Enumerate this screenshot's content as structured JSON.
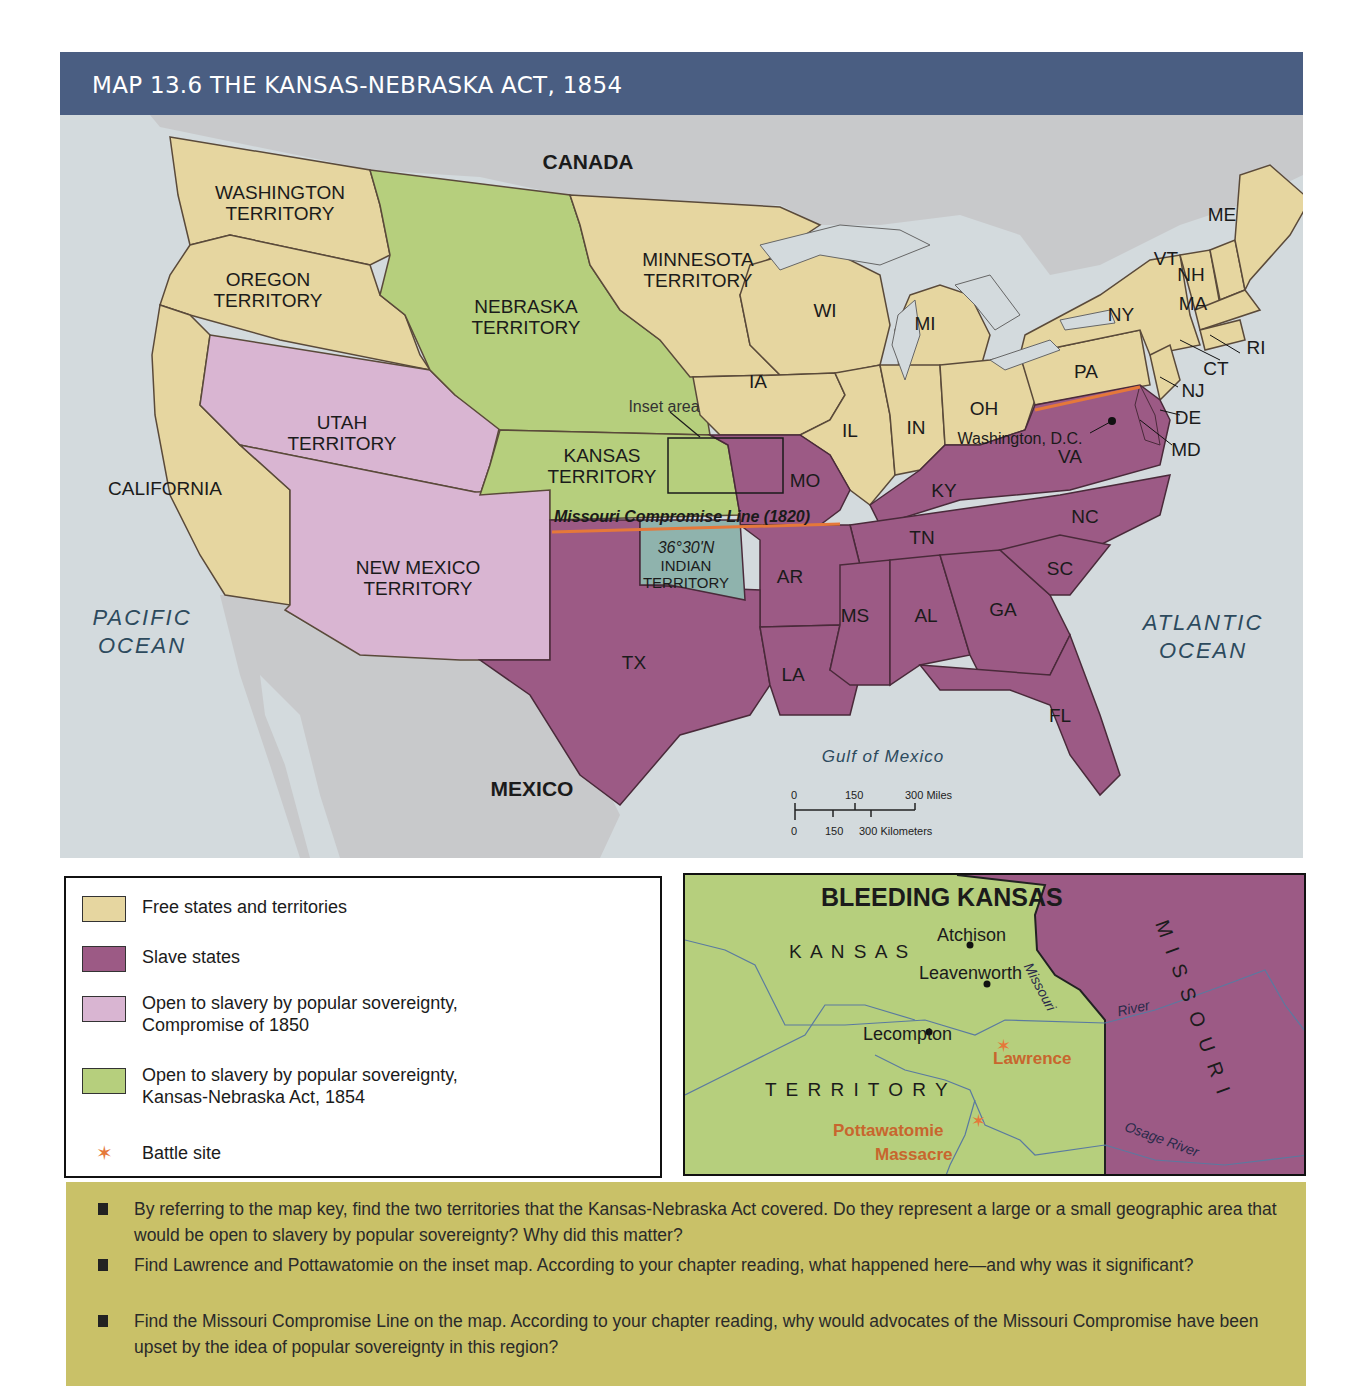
{
  "header": {
    "title": "MAP 13.6  THE KANSAS-NEBRASKA ACT, 1854"
  },
  "colors": {
    "header_bg": "#4a5e82",
    "free": "#e6d6a0",
    "slave": "#9c5a85",
    "compromise_1850": "#d9b5d2",
    "kansas_nebraska_1854": "#b6cf7d",
    "indian_territory": "#8fb3ad",
    "foreign_land": "#c8c9cb",
    "water": "#d3dadd",
    "missouri_line": "#e5783a",
    "question_box": "#c9c168"
  },
  "map": {
    "regions": {
      "canada": "CANADA",
      "mexico": "MEXICO",
      "pacific": "PACIFIC\nOCEAN",
      "atlantic": "ATLANTIC\nOCEAN",
      "gulf": "Gulf of Mexico"
    },
    "territories": {
      "washington": "WASHINGTON\nTERRITORY",
      "oregon": "OREGON\nTERRITORY",
      "california": "CALIFORNIA",
      "utah": "UTAH\nTERRITORY",
      "new_mexico": "NEW MEXICO\nTERRITORY",
      "nebraska": "NEBRASKA\nTERRITORY",
      "kansas": "KANSAS\nTERRITORY",
      "minnesota": "MINNESOTA\nTERRITORY",
      "indian": "INDIAN\nTERRITORY"
    },
    "states": {
      "wi": "WI",
      "mi": "MI",
      "ia": "IA",
      "il": "IL",
      "in": "IN",
      "oh": "OH",
      "ny": "NY",
      "pa": "PA",
      "me": "ME",
      "vt": "VT",
      "nh": "NH",
      "ma": "MA",
      "ri": "RI",
      "ct": "CT",
      "nj": "NJ",
      "de": "DE",
      "md": "MD",
      "va": "VA",
      "ky": "KY",
      "tn": "TN",
      "nc": "NC",
      "sc": "SC",
      "ga": "GA",
      "al": "AL",
      "ms": "MS",
      "la": "LA",
      "ar": "AR",
      "mo": "MO",
      "tx": "TX",
      "fl": "FL"
    },
    "washington_dc": "Washington, D.C.",
    "inset_area_label": "Inset area",
    "missouri_compromise_line": "Missouri Compromise Line (1820)",
    "latitude": "36°30'N",
    "scale": {
      "miles": [
        "0",
        "150",
        "300 Miles"
      ],
      "km": [
        "0",
        "150",
        "300 Kilometers"
      ]
    }
  },
  "legend": {
    "items": [
      {
        "label": "Free states and territories"
      },
      {
        "label": "Slave states"
      },
      {
        "label": "Open to slavery by popular sovereignty,\nCompromise of 1850"
      },
      {
        "label": "Open to slavery by popular sovereignty,\nKansas-Nebraska Act, 1854"
      },
      {
        "label": "Battle site"
      }
    ]
  },
  "inset": {
    "title": "BLEEDING KANSAS",
    "kansas": "K A N S A S",
    "territory": "T E R R I T O R Y",
    "missouri_state": "MISSOURI",
    "cities": {
      "atchison": "Atchison",
      "leavenworth": "Leavenworth",
      "lecompton": "Lecompton"
    },
    "battles": {
      "lawrence": "Lawrence",
      "pottawatomie_1": "Pottawatomie",
      "pottawatomie_2": "Massacre"
    },
    "rivers": {
      "missouri_1": "Missouri",
      "missouri_2": "River",
      "osage": "Osage River"
    }
  },
  "questions": [
    {
      "text": "By referring to the map key, find the two territories that the Kansas-Nebraska Act covered. Do they represent a large or a small geographic area that would be open to slavery by popular sovereignty? Why did this matter?"
    },
    {
      "text": "Find Lawrence and Pottawatomie on the inset map. According to your chapter reading, what happened here—and why was it significant?"
    },
    {
      "text": "Find the Missouri Compromise Line on the map. According to your chapter reading, why would advocates of the Missouri Compromise have been upset by the idea of popular sovereignty in this region?"
    }
  ]
}
